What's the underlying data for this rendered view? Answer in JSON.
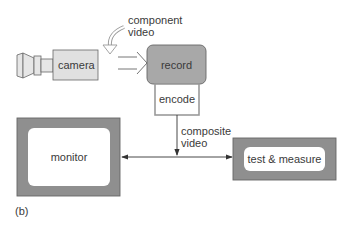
{
  "diagram": {
    "caption": "(b)",
    "nodes": {
      "camera": {
        "label": "camera"
      },
      "record": {
        "label": "record"
      },
      "encode": {
        "label": "encode"
      },
      "monitor": {
        "label": "monitor"
      },
      "test_measure": {
        "label": "test & measure"
      }
    },
    "edge_labels": {
      "component_line1": "component",
      "component_line2": "video",
      "composite_line1": "composite",
      "composite_line2": "video"
    },
    "colors": {
      "camera_fill": "#e0e0e0",
      "record_fill": "#a8a8a8",
      "frame_fill": "#8f8f8f",
      "stroke": "#555555",
      "encode_stroke": "#9a9a9a"
    }
  }
}
